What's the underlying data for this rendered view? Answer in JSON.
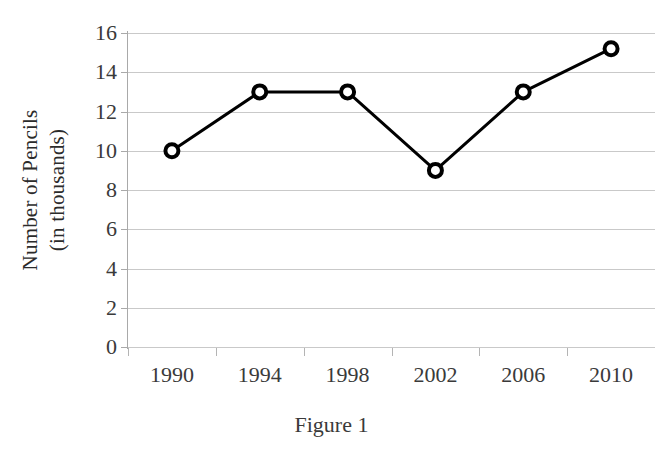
{
  "caption": "Figure 1",
  "chart_data": {
    "type": "line",
    "title": "",
    "subtitle": "",
    "xlabel": "",
    "ylabel_line1": "Number of Pencils",
    "ylabel_line2": "(in thousands)",
    "ylabel": "Number of Pencils (in thousands)",
    "categories": [
      "1990",
      "1994",
      "1998",
      "2002",
      "2006",
      "2010"
    ],
    "x": [
      1990,
      1994,
      1998,
      2002,
      2006,
      2010
    ],
    "values": [
      10,
      13,
      13,
      9,
      13,
      15.2
    ],
    "series": [
      {
        "name": "Number of Pencils",
        "values": [
          10,
          13,
          13,
          9,
          13,
          15.2
        ]
      }
    ],
    "ylim": [
      0,
      16
    ],
    "yticks": [
      0,
      2,
      4,
      6,
      8,
      10,
      12,
      14,
      16
    ],
    "ytick_labels": [
      "0",
      "2",
      "4",
      "6",
      "8",
      "10",
      "12",
      "14",
      "16"
    ],
    "xtick_labels": [
      "1990",
      "1994",
      "1998",
      "2002",
      "2006",
      "2010"
    ],
    "grid": "horizontal",
    "legend": "none",
    "line_color": "#000000",
    "marker_fill": "#ffffff",
    "marker_edge": "#000000",
    "gridline_color": "#c9c9c9",
    "axis_color": "#a9a9a9",
    "text_color": "#3a3a3a"
  }
}
